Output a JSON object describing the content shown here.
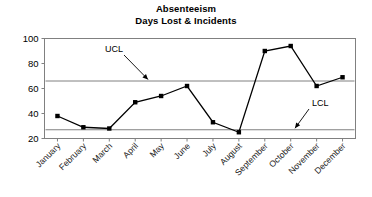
{
  "chart_data": {
    "type": "line",
    "title": "Absenteeism",
    "subtitle": "Days Lost & Incidents",
    "xlabel": "",
    "ylabel": "",
    "categories": [
      "January",
      "February",
      "March",
      "April",
      "May",
      "June",
      "July",
      "August",
      "September",
      "October",
      "November",
      "December"
    ],
    "series": [
      {
        "name": "Days Lost & Incidents",
        "values": [
          38,
          29,
          28,
          49,
          54,
          62,
          33,
          25,
          90,
          94,
          62,
          69
        ],
        "color": "#000000",
        "marker": "square"
      }
    ],
    "control_limits": [
      {
        "name": "UCL",
        "label": "UCL",
        "value": 66,
        "color": "#808080"
      },
      {
        "name": "LCL",
        "label": "LCL",
        "value": 27,
        "color": "#808080"
      }
    ],
    "annotations": [
      {
        "text": "UCL",
        "target_category": "April",
        "target_value": 66
      },
      {
        "text": "LCL",
        "target_category": "October",
        "target_value": 27
      }
    ],
    "ylim": [
      20,
      100
    ],
    "yticks": [
      20,
      40,
      60,
      80,
      100
    ],
    "ytick_labels": [
      "20",
      "40",
      "60",
      "80",
      "100"
    ],
    "grid": false,
    "legend": "none",
    "plot_border_color": "#808080",
    "background_color": "#ffffff"
  },
  "chart": {
    "title": "Absenteeism",
    "subtitle": "Days Lost & Incidents"
  }
}
